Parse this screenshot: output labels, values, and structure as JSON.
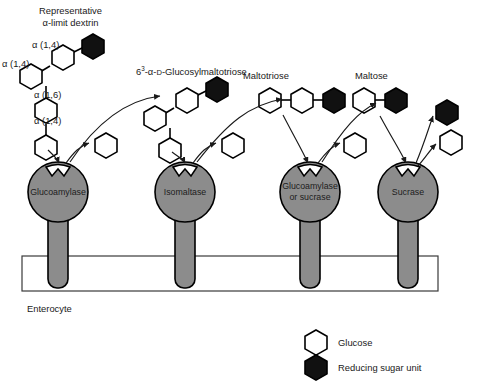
{
  "figure": {
    "background": "#ffffff",
    "enzyme_fill": "#8c8c8c",
    "enzyme_stroke": "#000000",
    "reducing_sugar_fill": "#111111",
    "glucose_fill": "#ffffff",
    "membrane_stroke": "#3a3a3a"
  },
  "substrates": [
    {
      "id": "alpha-limit-dextrin",
      "label_line1": "Representative",
      "label_line2": "α-limit dextrin",
      "bonds": [
        "α (1,4)",
        "α (1,4)",
        "α (1,6)",
        "α (1,4)"
      ]
    },
    {
      "id": "glucosylmaltotriose",
      "label_prefix": "6",
      "label_sup": "3",
      "label_rest": "-α-",
      "label_smallcap": "D",
      "label_tail": "-Glucosylmaltotriose"
    },
    {
      "id": "maltotriose",
      "label": "Maltotriose"
    },
    {
      "id": "maltose",
      "label": "Maltose"
    }
  ],
  "enzymes": [
    {
      "id": "glucoamylase",
      "line1": "Glucoamylase",
      "line2": "",
      "cx": 58,
      "cy": 192
    },
    {
      "id": "isomaltase",
      "line1": "Isomaltase",
      "line2": "",
      "cx": 185,
      "cy": 192
    },
    {
      "id": "glucoamylase-or-sucrase",
      "line1": "Glucoamylase",
      "line2": "or sucrase",
      "cx": 310,
      "cy": 192
    },
    {
      "id": "sucrase",
      "line1": "Sucrase",
      "line2": "",
      "cx": 408,
      "cy": 192
    }
  ],
  "membrane": {
    "label": "Enterocyte",
    "x": 22,
    "y": 256,
    "width": 416,
    "height": 35
  },
  "legend": {
    "items": [
      {
        "shape": "hexagon-open",
        "label": "Glucose",
        "fill": "#ffffff"
      },
      {
        "shape": "hexagon-filled",
        "label": "Reducing sugar unit",
        "fill": "#111111"
      }
    ]
  }
}
